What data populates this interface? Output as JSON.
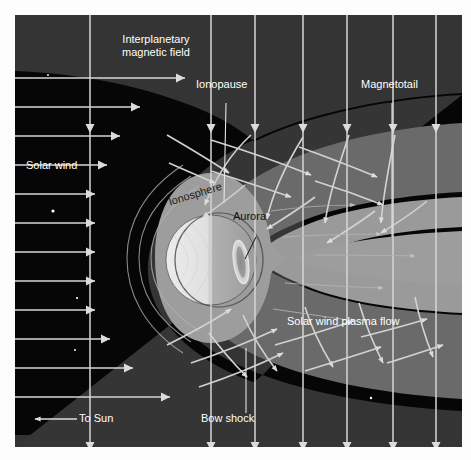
{
  "figure": {
    "kind": "planetary-magnetosphere-diagram",
    "background_color": "#060606",
    "page_color": "#fdfdfd"
  },
  "palette": {
    "space_black": "#060606",
    "bow_shock_band": "#3b3b3b",
    "magnetosheath": "#6e6e6e",
    "ionosphere_shell": "#9a9a9a",
    "plasma_tail": "#8d8d8d",
    "planet_day_side": "#e2e2e2",
    "planet_night_side": "#a6a6a6",
    "aurora": "#d8d8d8",
    "arrow_white": "#dcdcdc",
    "leader_line": "#e8e8e8",
    "star": "#ffffff"
  },
  "labels": {
    "interplanetary_field_line1": "Interplanetary",
    "interplanetary_field_line2": "magnetic field",
    "ionopause": "Ionopause",
    "magnetotail": "Magnetotail",
    "solar_wind": "Solar wind",
    "ionosphere": "Ionosphere",
    "aurora": "Aurora",
    "solar_wind_plasma_flow": "Solar wind plasma flow",
    "to_sun": "To Sun",
    "bow_shock": "Bow shock"
  },
  "label_positions": {
    "interplanetary_field": {
      "x": 96,
      "y": 28
    },
    "ionopause": {
      "x": 197,
      "y": 78
    },
    "magnetotail": {
      "x": 364,
      "y": 78
    },
    "solar_wind": {
      "x": 26,
      "y": 158
    },
    "ionosphere": {
      "x": 170,
      "y": 192
    },
    "aurora": {
      "x": 234,
      "y": 210
    },
    "solar_wind_plasma_flow": {
      "x": 291,
      "y": 313
    },
    "to_sun": {
      "x": 76,
      "y": 419
    },
    "bow_shock": {
      "x": 199,
      "y": 419
    }
  },
  "chart_data": {
    "type": "diagram",
    "regions": [
      {
        "name": "interplanetary space",
        "fill": "#060606"
      },
      {
        "name": "bow shock sheath",
        "fill": "#3b3b3b"
      },
      {
        "name": "magnetosheath",
        "fill": "#6e6e6e"
      },
      {
        "name": "ionosphere shell",
        "fill": "#9a9a9a"
      },
      {
        "name": "plasma tail",
        "fill": "#8d8d8d"
      },
      {
        "name": "planet",
        "day_fill": "#e2e2e2",
        "night_fill": "#a6a6a6"
      }
    ],
    "planet": {
      "cx": 196,
      "cy": 245,
      "r": 45,
      "terminator_x": 196
    },
    "aurora_oval": {
      "cx": 226,
      "cy": 247,
      "rx": 7,
      "ry": 22,
      "rotation": -8
    },
    "vertical_field_lines_x": [
      75,
      196,
      240,
      288,
      332,
      378,
      421
    ],
    "horizontal_solar_wind_y": [
      63,
      92,
      121,
      150,
      179,
      208,
      237,
      266,
      295,
      324,
      353,
      382
    ],
    "flow_arrow_color": "#dcdcdc"
  },
  "stars": [
    {
      "x": 38,
      "y": 196,
      "r": 1.6
    },
    {
      "x": 33,
      "y": 60,
      "r": 0.9
    },
    {
      "x": 62,
      "y": 283,
      "r": 1.1
    },
    {
      "x": 60,
      "y": 335,
      "r": 1.0
    },
    {
      "x": 83,
      "y": 373,
      "r": 1.0
    },
    {
      "x": 119,
      "y": 400,
      "r": 1.0
    },
    {
      "x": 268,
      "y": 413,
      "r": 1.4
    },
    {
      "x": 307,
      "y": 53,
      "r": 0.9
    },
    {
      "x": 262,
      "y": 74,
      "r": 0.9
    },
    {
      "x": 333,
      "y": 422,
      "r": 1.5
    },
    {
      "x": 388,
      "y": 412,
      "r": 1.1
    },
    {
      "x": 420,
      "y": 430,
      "r": 1.0
    },
    {
      "x": 356,
      "y": 383,
      "r": 1.2
    },
    {
      "x": 405,
      "y": 360,
      "r": 0.9
    }
  ]
}
